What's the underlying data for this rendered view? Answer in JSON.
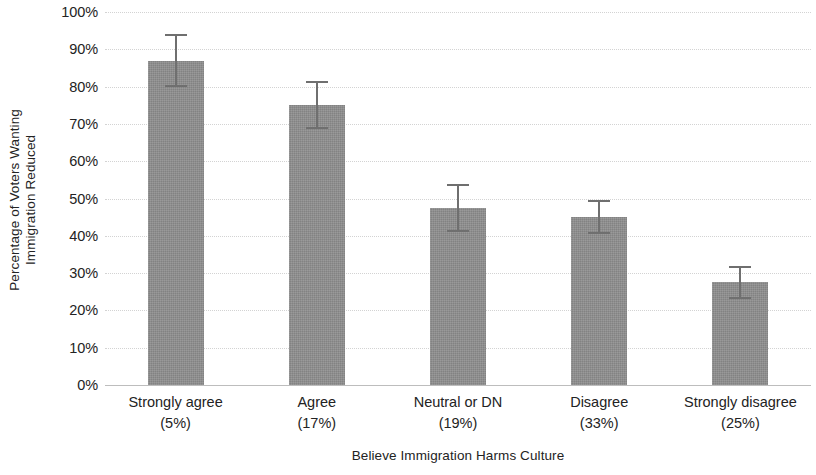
{
  "chart_data": {
    "type": "bar",
    "title": "",
    "xlabel": "Believe Immigration Harms Culture",
    "ylabel": "Percentage of Voters Wanting Immigration Reduced",
    "ylabel_line1": "Percentage of Voters Wanting",
    "ylabel_line2": "Immigration Reduced",
    "categories": [
      "Strongly agree",
      "Agree",
      "Neutral or DN",
      "Disagree",
      "Strongly disagree"
    ],
    "category_shares": [
      "(5%)",
      "(17%)",
      "(19%)",
      "(33%)",
      "(25%)"
    ],
    "values": [
      87,
      75,
      47.5,
      45,
      27.5
    ],
    "errors": [
      7,
      6.5,
      6.5,
      4.5,
      4.5
    ],
    "ylim": [
      0,
      100
    ],
    "ytick_values": [
      100,
      90,
      80,
      70,
      60,
      50,
      40,
      30,
      20,
      10,
      0
    ],
    "ytick_labels": [
      "100%",
      "90%",
      "80%",
      "70%",
      "60%",
      "50%",
      "40%",
      "30%",
      "20%",
      "10%",
      "0%"
    ],
    "grid": true,
    "legend": "none",
    "bar_color": "#8e8e8e",
    "error_color": "#6f6f6f",
    "grid_color": "#d3d3d3",
    "text_color": "#232323"
  }
}
